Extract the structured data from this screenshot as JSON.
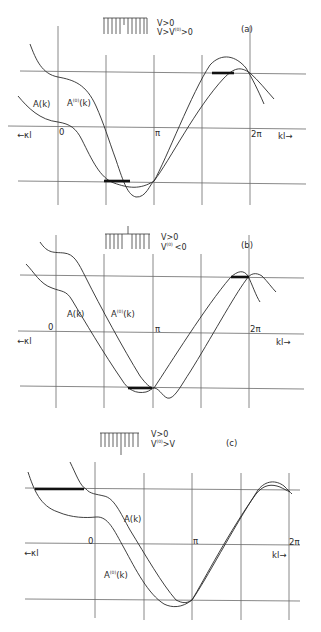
{
  "figure": {
    "panels": [
      {
        "id": "a",
        "tag": "(a)",
        "condition_line1": "V>0",
        "condition_line2_main": "V>V",
        "condition_line2_sup": "(0)",
        "condition_line2_tail": ">0",
        "curve_label_1": "A(k)",
        "curve_label_2_main": "A",
        "curve_label_2_sup": "(0)",
        "curve_label_2_tail": "(k)",
        "tick_0": "0",
        "tick_pi": "π",
        "tick_2pi": "2π",
        "left_axis_label": "←κl",
        "right_axis_label": "kl→"
      },
      {
        "id": "b",
        "tag": "(b)",
        "condition_line1": "V>0",
        "condition_line2_main": "V",
        "condition_line2_sup": "(0)",
        "condition_line2_tail": "<0",
        "curve_label_1": "A(k)",
        "curve_label_2_main": "A",
        "curve_label_2_sup": "(0)",
        "curve_label_2_tail": "(k)",
        "tick_0": "0",
        "tick_pi": "π",
        "tick_2pi": "2π",
        "left_axis_label": "←κl",
        "right_axis_label": "kl→"
      },
      {
        "id": "c",
        "tag": "(c)",
        "condition_line1": "V>0",
        "condition_line2_main": "V",
        "condition_line2_sup": "(0)",
        "condition_line2_tail": ">V",
        "curve_label_1": "A(k)",
        "curve_label_2_main": "A",
        "curve_label_2_sup": "(0)",
        "curve_label_2_tail": "(k)",
        "tick_0": "0",
        "tick_pi": "π",
        "tick_2pi": "2π",
        "left_axis_label": "←κl",
        "right_axis_label": "kl→"
      }
    ]
  }
}
